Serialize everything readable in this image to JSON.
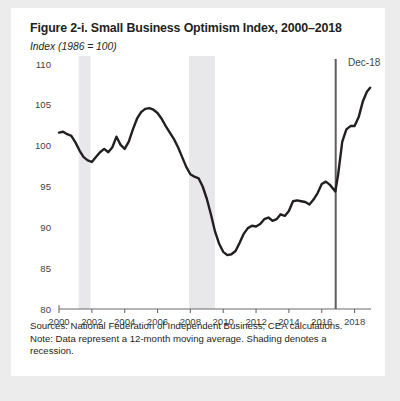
{
  "figure": {
    "title": "Figure 2-i. Small Business Optimism Index, 2000–2018",
    "units_label": "Index (1986 = 100)",
    "sources_note": "Sources: National Federation of Independent Business; CEA calculations.",
    "data_note": "Note: Data represent a 12-month moving average. Shading denotes a recession."
  },
  "chart_data": {
    "type": "line",
    "title": "Figure 2-i. Small Business Optimism Index, 2000–2018",
    "subtitle": "Index (1986 = 100)",
    "xlabel": "",
    "ylabel": "Index (1986 = 100)",
    "xlim": [
      2000,
      2019
    ],
    "ylim": [
      80,
      110
    ],
    "ytick_values": [
      80,
      85,
      90,
      95,
      100,
      105,
      110
    ],
    "xtick_values": [
      2000,
      2002,
      2004,
      2006,
      2008,
      2010,
      2012,
      2014,
      2016,
      2018
    ],
    "grid": false,
    "legend": false,
    "line_color": "#231f20",
    "line_width": 2.4,
    "series": [
      {
        "name": "Small Business Optimism Index (12-month moving average)",
        "x": [
          2000.0,
          2000.25,
          2000.5,
          2000.75,
          2001.0,
          2001.25,
          2001.5,
          2001.75,
          2002.0,
          2002.25,
          2002.5,
          2002.75,
          2003.0,
          2003.25,
          2003.5,
          2003.75,
          2004.0,
          2004.25,
          2004.5,
          2004.75,
          2005.0,
          2005.25,
          2005.5,
          2005.75,
          2006.0,
          2006.25,
          2006.5,
          2006.75,
          2007.0,
          2007.25,
          2007.5,
          2007.75,
          2008.0,
          2008.25,
          2008.5,
          2008.75,
          2009.0,
          2009.25,
          2009.5,
          2009.75,
          2010.0,
          2010.25,
          2010.5,
          2010.75,
          2011.0,
          2011.25,
          2011.5,
          2011.75,
          2012.0,
          2012.25,
          2012.5,
          2012.75,
          2013.0,
          2013.25,
          2013.5,
          2013.75,
          2014.0,
          2014.25,
          2014.5,
          2014.75,
          2015.0,
          2015.25,
          2015.5,
          2015.75,
          2016.0,
          2016.25,
          2016.5,
          2016.83,
          2017.0,
          2017.25,
          2017.5,
          2017.75,
          2018.0,
          2018.25,
          2018.5,
          2018.75,
          2018.95
        ],
        "y": [
          101.6,
          101.7,
          101.4,
          101.2,
          100.4,
          99.4,
          98.6,
          98.2,
          98.0,
          98.6,
          99.2,
          99.6,
          99.2,
          99.8,
          101.1,
          100.1,
          99.6,
          100.5,
          102.0,
          103.3,
          104.1,
          104.5,
          104.6,
          104.4,
          104.0,
          103.3,
          102.4,
          101.6,
          100.8,
          99.8,
          98.6,
          97.4,
          96.5,
          96.2,
          96.0,
          95.0,
          93.5,
          91.6,
          89.5,
          88.0,
          87.0,
          86.6,
          86.7,
          87.1,
          88.1,
          89.2,
          89.9,
          90.2,
          90.1,
          90.4,
          91.0,
          91.2,
          90.8,
          91.0,
          91.6,
          91.4,
          92.0,
          93.2,
          93.3,
          93.2,
          93.1,
          92.8,
          93.4,
          94.2,
          95.3,
          95.6,
          95.2,
          94.4,
          96.5,
          100.5,
          102.0,
          102.4,
          102.4,
          103.5,
          105.4,
          106.6,
          107.1
        ]
      }
    ],
    "recession_bands": [
      {
        "start": 2001.2,
        "end": 2001.92,
        "label": "recession"
      },
      {
        "start": 2007.92,
        "end": 2009.5,
        "label": "recession"
      }
    ],
    "recession_band_color": "#e8e8ea",
    "annotations": [
      {
        "name": "election",
        "label": "Election",
        "x": 2016.85,
        "type": "vline",
        "color": "#5d5d63"
      },
      {
        "name": "last-point",
        "label": "Dec-18",
        "x": 2018.95,
        "y": 107.1,
        "type": "point-label"
      }
    ]
  }
}
